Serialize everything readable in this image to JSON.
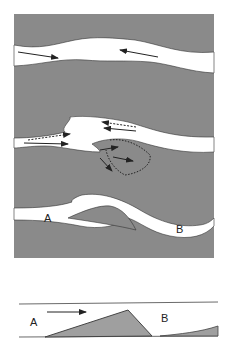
{
  "figure": {
    "plan_view": {
      "labels": {
        "a": "A",
        "b": "B"
      },
      "colors": {
        "sediment": "#8a8a8a",
        "channel": "#ffffff",
        "outline": "#333333",
        "arrow": "#222222"
      }
    },
    "cross_section": {
      "labels": {
        "a": "A",
        "b": "B"
      },
      "colors": {
        "bar_fill": "#9a9a9a",
        "line": "#444444"
      }
    }
  }
}
